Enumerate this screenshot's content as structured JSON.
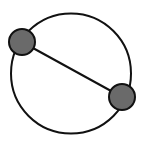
{
  "diagram": {
    "type": "circle-graph",
    "background": "#ffffff",
    "stroke_color": "#111111",
    "node_fill": "#6a6a6a",
    "outer_circle": {
      "cx": 71,
      "cy": 73.5,
      "r": 60,
      "stroke_width": 2
    },
    "nodes": [
      {
        "id": "node-left",
        "cx": 22,
        "cy": 42,
        "r": 13
      },
      {
        "id": "node-right",
        "cx": 122,
        "cy": 97,
        "r": 13
      }
    ],
    "edges": [
      {
        "from": "node-left",
        "to": "node-right",
        "stroke_width": 2
      }
    ]
  }
}
